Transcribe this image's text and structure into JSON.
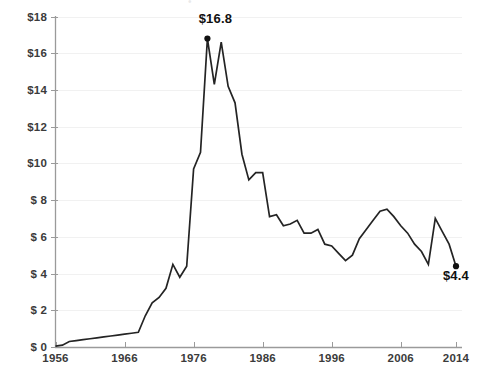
{
  "chart_data": {
    "type": "line",
    "title": "",
    "xlabel": "",
    "ylabel": "",
    "xlim": [
      1956,
      2014
    ],
    "ylim": [
      0,
      18
    ],
    "grid": true,
    "legend_position": "none",
    "y_tick_labels": [
      "$18",
      "$16",
      "$14",
      "$12",
      "$10",
      "$ 8",
      "$ 6",
      "$ 4",
      "$ 2",
      "$ 0"
    ],
    "y_tick_values": [
      18,
      16,
      14,
      12,
      10,
      8,
      6,
      4,
      2,
      0
    ],
    "x_tick_labels": [
      "1956",
      "1966",
      "1976",
      "1986",
      "1996",
      "2006",
      "2014"
    ],
    "x_tick_values": [
      1956,
      1966,
      1976,
      1986,
      1996,
      2006,
      2014
    ],
    "series": [
      {
        "name": "value",
        "color": "#242424",
        "x": [
          1956,
          1957,
          1958,
          1959,
          1960,
          1961,
          1962,
          1963,
          1964,
          1965,
          1966,
          1967,
          1968,
          1969,
          1970,
          1971,
          1972,
          1973,
          1974,
          1975,
          1976,
          1977,
          1978,
          1979,
          1980,
          1981,
          1982,
          1983,
          1984,
          1985,
          1986,
          1987,
          1988,
          1989,
          1990,
          1991,
          1992,
          1993,
          1994,
          1995,
          1996,
          1997,
          1998,
          1999,
          2000,
          2001,
          2002,
          2003,
          2004,
          2005,
          2006,
          2007,
          2008,
          2009,
          2010,
          2011,
          2012,
          2013,
          2014
        ],
        "y": [
          0.05,
          0.1,
          0.3,
          0.35,
          0.4,
          0.45,
          0.5,
          0.55,
          0.6,
          0.65,
          0.7,
          0.75,
          0.8,
          1.7,
          2.4,
          2.7,
          3.2,
          4.5,
          3.8,
          4.4,
          9.7,
          10.6,
          16.8,
          14.3,
          16.6,
          14.2,
          13.3,
          10.5,
          9.1,
          9.5,
          9.5,
          7.1,
          7.2,
          6.6,
          6.7,
          6.9,
          6.2,
          6.2,
          6.4,
          5.6,
          5.5,
          5.1,
          4.7,
          5.0,
          5.9,
          6.4,
          6.9,
          7.4,
          7.5,
          7.1,
          6.6,
          6.2,
          5.6,
          5.2,
          4.5,
          7.0,
          6.3,
          5.6,
          4.4
        ]
      }
    ],
    "annotations": [
      {
        "name": "peak-label",
        "text": "$16.8",
        "x": 1978,
        "y": 16.8,
        "marker": true,
        "label_offset_x": -2,
        "label_offset_y": -20
      },
      {
        "name": "end-label",
        "text": "$4.4",
        "x": 2014,
        "y": 4.4,
        "marker": true,
        "label_offset_x": -10,
        "label_offset_y": 10
      }
    ],
    "colors": {
      "line": "#242424",
      "axis": "#9a9a9a",
      "grid": "#f1f1f1",
      "tick_text": "#3b3b3b",
      "annotation_text": "#111111",
      "background": "#ffffff"
    }
  }
}
